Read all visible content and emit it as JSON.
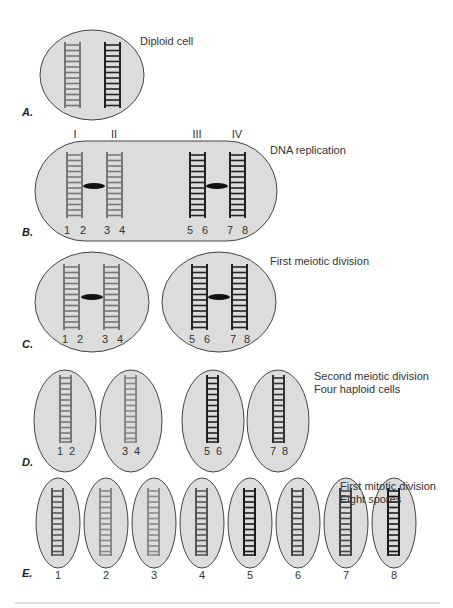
{
  "colors": {
    "cell_fill": "#dcdcdc",
    "cell_stroke": "#444444",
    "ladder_gray": "#777777",
    "ladder_light": "#8a8a8a",
    "ladder_dark": "#222222",
    "ladder_mid": "#555555",
    "centromere": "#111111",
    "rule": "#bbbbbb"
  },
  "stages": {
    "A": {
      "letter": "A.",
      "caption": "Diploid cell"
    },
    "B": {
      "letter": "B.",
      "caption": "DNA replication",
      "chromatids": [
        "I",
        "II",
        "III",
        "IV"
      ],
      "strands": [
        "1",
        "2",
        "3",
        "4",
        "5",
        "6",
        "7",
        "8"
      ]
    },
    "C": {
      "letter": "C.",
      "caption": "First meiotic division",
      "strands": [
        "1",
        "2",
        "3",
        "4",
        "5",
        "6",
        "7",
        "8"
      ]
    },
    "D": {
      "letter": "D.",
      "caption_line1": "Second meiotic division",
      "caption_line2": "Four haploid cells",
      "strands": [
        "1",
        "2",
        "3",
        "4",
        "5",
        "6",
        "7",
        "8"
      ]
    },
    "E": {
      "letter": "E.",
      "caption_line1": "First mitotic division",
      "caption_line2": "Eight spores",
      "spores": [
        "1",
        "2",
        "3",
        "4",
        "5",
        "6",
        "7",
        "8"
      ]
    }
  }
}
